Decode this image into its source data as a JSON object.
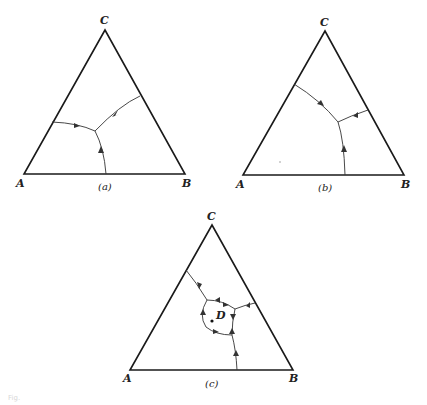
{
  "figure": {
    "panels": [
      {
        "id": "a",
        "caption": "(a)",
        "vertices": {
          "top": "C",
          "left": "A",
          "right": "B"
        }
      },
      {
        "id": "b",
        "caption": "(b)",
        "vertices": {
          "top": "C",
          "left": "A",
          "right": "B"
        }
      },
      {
        "id": "c",
        "caption": "(c)",
        "vertices": {
          "top": "C",
          "left": "A",
          "right": "B"
        },
        "point_label": "D"
      }
    ],
    "footer_caption": "Fig."
  }
}
